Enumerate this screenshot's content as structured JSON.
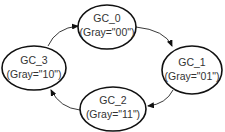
{
  "diagram": {
    "type": "state-machine",
    "colors": {
      "stroke": "#111111",
      "text": "#333333",
      "background": "#ffffff"
    },
    "states": [
      {
        "id": "GC_0",
        "name": "GC_0",
        "value": "(Gray=\"00\")"
      },
      {
        "id": "GC_1",
        "name": "GC_1",
        "value": "(Gray=\"01\")"
      },
      {
        "id": "GC_2",
        "name": "GC_2",
        "value": "(Gray=\"11\")"
      },
      {
        "id": "GC_3",
        "name": "GC_3",
        "value": "(Gray=\"10\")"
      }
    ],
    "transitions": [
      {
        "from": "GC_0",
        "to": "GC_1"
      },
      {
        "from": "GC_1",
        "to": "GC_2"
      },
      {
        "from": "GC_2",
        "to": "GC_3"
      },
      {
        "from": "GC_3",
        "to": "GC_0"
      }
    ]
  }
}
